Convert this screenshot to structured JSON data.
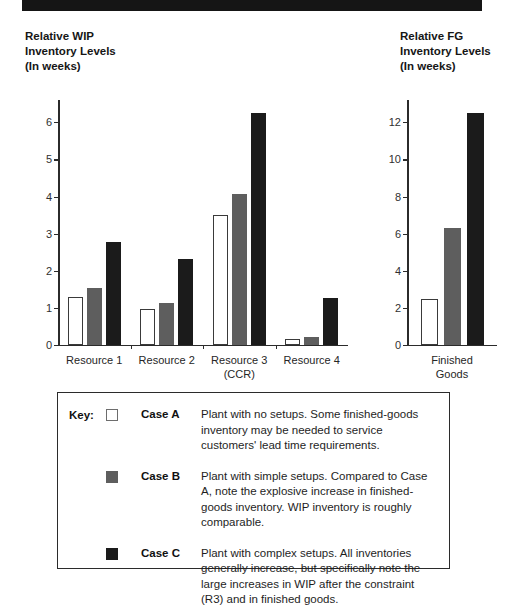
{
  "banner": {
    "text": ""
  },
  "charts": {
    "wip": {
      "title": "Relative WIP\nInventory Levels\n(In weeks)"
    },
    "fg": {
      "title": "Relative FG\nInventory Levels\n(In weeks)"
    }
  },
  "key": {
    "label": "Key:",
    "entries": [
      {
        "swatch": "white-square-swatch",
        "name": "Case A",
        "description": "Plant with no setups. Some finished-goods inventory may be needed to service customers' lead time requirements."
      },
      {
        "swatch": "gray-square-swatch",
        "name": "Case B",
        "description": "Plant with simple setups. Compared to Case A, note the explosive increase in finished-goods inventory. WIP inventory is roughly comparable."
      },
      {
        "swatch": "black-square-swatch",
        "name": "Case C",
        "description": "Plant with complex setups. All inventories generally increase, but specifically note the large increases in WIP after the constraint (R3) and in finished goods."
      }
    ]
  },
  "colors": {
    "case_a": "#ffffff",
    "case_a_border": "#3a3a3a",
    "case_b": "#5e5e5e",
    "case_c": "#1b1b1b",
    "axis": "#2b2b2b",
    "text": "#1a1a1a"
  },
  "chart_data": [
    {
      "id": "wip",
      "type": "bar",
      "title": "Relative WIP Inventory Levels (In weeks)",
      "xlabel": "",
      "ylabel": "",
      "ylim": [
        0,
        6.6
      ],
      "yticks": [
        0,
        1,
        2,
        3,
        4,
        5,
        6
      ],
      "ytick_labels": [
        "0",
        "1",
        "2",
        "3",
        "4",
        "5",
        "6"
      ],
      "grid": false,
      "legend_position": "below-chart-key-box",
      "categories": [
        "Resource 1",
        "Resource 2",
        "Resource 3\n(CCR)",
        "Resource 4"
      ],
      "series": [
        {
          "name": "Case A",
          "values": [
            1.28,
            0.97,
            3.5,
            0.15
          ]
        },
        {
          "name": "Case B",
          "values": [
            1.52,
            1.12,
            4.05,
            0.2
          ]
        },
        {
          "name": "Case C",
          "values": [
            2.75,
            2.3,
            6.25,
            1.25
          ]
        }
      ]
    },
    {
      "id": "fg",
      "type": "bar",
      "title": "Relative FG Inventory Levels (In weeks)",
      "xlabel": "",
      "ylabel": "",
      "ylim": [
        0,
        13.2
      ],
      "yticks": [
        0,
        2,
        4,
        6,
        8,
        10,
        12
      ],
      "ytick_labels": [
        "0",
        "2",
        "4",
        "6",
        "8",
        "10",
        "12"
      ],
      "grid": false,
      "legend_position": "below-chart-key-box",
      "categories": [
        "Finished\nGoods"
      ],
      "series": [
        {
          "name": "Case A",
          "values": [
            2.45
          ]
        },
        {
          "name": "Case B",
          "values": [
            6.3
          ]
        },
        {
          "name": "Case C",
          "values": [
            12.5
          ]
        }
      ]
    }
  ]
}
